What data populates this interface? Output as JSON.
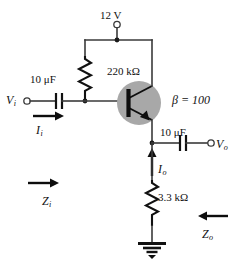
{
  "figure": {
    "kind": "circuit-schematic"
  },
  "labels": {
    "supply_voltage": "12 V",
    "base_resistor": "220 kΩ",
    "input_capacitor": "10 μF",
    "output_capacitor": "10 μF",
    "emitter_resistor": "3.3 kΩ",
    "beta": "β = 100"
  },
  "symbols": {
    "input_voltage": {
      "base": "V",
      "sub": "i"
    },
    "output_voltage": {
      "base": "V",
      "sub": "o"
    },
    "input_current": {
      "base": "I",
      "sub": "i"
    },
    "output_current": {
      "base": "I",
      "sub": "o"
    },
    "input_impedance": {
      "base": "Z",
      "sub": "i"
    },
    "output_impedance": {
      "base": "Z",
      "sub": "o"
    }
  },
  "components": [
    {
      "id": "supply-terminal",
      "type": "terminal",
      "label": "12 V"
    },
    {
      "id": "resistor-rb",
      "type": "resistor",
      "label": "220 kΩ"
    },
    {
      "id": "capacitor-cin",
      "type": "capacitor",
      "label": "10 μF"
    },
    {
      "id": "transistor-q1",
      "type": "npn-bjt",
      "label": "β = 100"
    },
    {
      "id": "capacitor-cout",
      "type": "capacitor",
      "label": "10 μF"
    },
    {
      "id": "resistor-re",
      "type": "resistor",
      "label": "3.3 kΩ"
    },
    {
      "id": "ground",
      "type": "ground",
      "label": ""
    }
  ],
  "colors": {
    "wire": "#3a3a3a",
    "device": "#111111",
    "transistor_halo": "#a8a8a8",
    "background": "#ffffff"
  }
}
